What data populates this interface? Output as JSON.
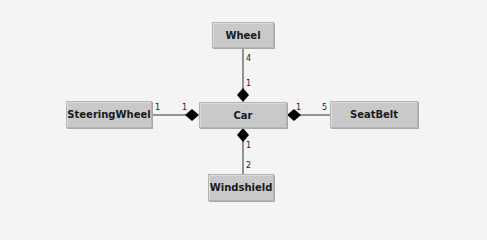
{
  "diagram": {
    "type": "UML class composition",
    "classes": {
      "center": "Car",
      "top": "Wheel",
      "left": "SteeringWheel",
      "right": "SeatBelt",
      "bottom": "Windshield"
    },
    "associations": [
      {
        "part": "Wheel",
        "whole_mult": "1",
        "part_mult": "4"
      },
      {
        "part": "SteeringWheel",
        "whole_mult": "1",
        "part_mult": "1"
      },
      {
        "part": "SeatBelt",
        "whole_mult": "1",
        "part_mult": "5"
      },
      {
        "part": "Windshield",
        "whole_mult": "1",
        "part_mult": "2"
      }
    ]
  }
}
